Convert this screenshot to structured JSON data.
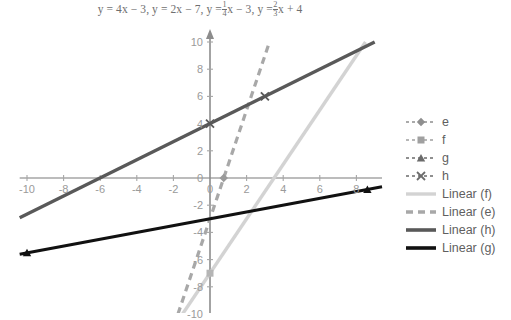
{
  "chart_data": {
    "type": "line",
    "title_parts": {
      "eq1": "y = 4x − 3,",
      "eq2": "y = 2x − 7,",
      "eq3_prefix": "y =",
      "eq3_num": "1",
      "eq3_den": "4",
      "eq3_suffix": "x − 3,",
      "eq4_prefix": "y =",
      "eq4_num": "2",
      "eq4_den": "3",
      "eq4_suffix": "x + 4"
    },
    "xlabel": "",
    "ylabel": "",
    "xlim": [
      -10.4,
      9.4
    ],
    "ylim": [
      -10,
      10
    ],
    "xticks": [
      -10,
      -8,
      -6,
      -4,
      -2,
      0,
      2,
      4,
      6,
      8
    ],
    "yticks": [
      10,
      8,
      6,
      4,
      2,
      0,
      -2,
      -4,
      -6,
      -8,
      -10
    ],
    "xtick_labels": [
      "-10",
      "-8",
      "-6",
      "-4",
      "-2",
      "0",
      "2",
      "4",
      "6",
      "8"
    ],
    "ytick_labels": [
      "10",
      "8",
      "6",
      "4",
      "2",
      "0",
      "-2",
      "-4",
      "-6",
      "-8",
      "-10"
    ],
    "grid": false,
    "legend_position": "right",
    "series": [
      {
        "name": "e",
        "equation": "y = 4x - 3",
        "slope": 4,
        "intercept": -3,
        "color": "#a8a8a8",
        "style": "dashed",
        "width": 3.2,
        "marker": "diamond",
        "points": [
          [
            -1.75,
            -10
          ],
          [
            3.25,
            10
          ]
        ]
      },
      {
        "name": "f",
        "equation": "y = 2x - 7",
        "slope": 2,
        "intercept": -7,
        "color": "#d3d3d3",
        "style": "solid",
        "width": 3.4,
        "marker": "square",
        "points": [
          [
            -1.5,
            -10
          ],
          [
            8.5,
            10
          ]
        ]
      },
      {
        "name": "g",
        "equation": "y = 1/4x - 3",
        "slope": 0.25,
        "intercept": -3,
        "color": "#111111",
        "style": "solid",
        "width": 3.0,
        "marker": "triangle",
        "points": [
          [
            -10.4,
            -5.6
          ],
          [
            9.4,
            -0.65
          ]
        ]
      },
      {
        "name": "h",
        "equation": "y = 2/3x + 4",
        "slope": 0.6667,
        "intercept": 4,
        "color": "#595959",
        "style": "solid",
        "width": 3.4,
        "marker": "cross",
        "points": [
          [
            -10.4,
            -2.93
          ],
          [
            9.0,
            10
          ]
        ]
      }
    ],
    "data_markers": [
      {
        "series": "f",
        "x": 0,
        "y": -7,
        "marker": "square"
      },
      {
        "series": "h",
        "x": 0,
        "y": 4,
        "marker": "cross"
      },
      {
        "series": "h",
        "x": 3,
        "y": 6,
        "marker": "cross"
      },
      {
        "series": "g",
        "x": -10,
        "y": -5.5,
        "marker": "triangle"
      },
      {
        "series": "g",
        "x": 8.6,
        "y": -0.85,
        "marker": "triangle"
      },
      {
        "series": "e",
        "x": 0.75,
        "y": 0,
        "marker": "diamond"
      }
    ],
    "legend": [
      {
        "label": "e",
        "key": "marker-diamond",
        "color": "#8f8f8f",
        "style": "dotted-line-marker"
      },
      {
        "label": "f",
        "key": "marker-square",
        "color": "#a0a0a0",
        "style": "dotted-line-marker"
      },
      {
        "label": "g",
        "key": "marker-triangle",
        "color": "#6b6b6b",
        "style": "dotted-line-marker"
      },
      {
        "label": "h",
        "key": "marker-cross",
        "color": "#6b6b6b",
        "style": "dotted-line-marker"
      },
      {
        "label": "Linear (f)",
        "key": "line-f",
        "color": "#d3d3d3",
        "style": "solid"
      },
      {
        "label": "Linear (e)",
        "key": "line-e",
        "color": "#a8a8a8",
        "style": "dashed"
      },
      {
        "label": "Linear (h)",
        "key": "line-h",
        "color": "#595959",
        "style": "solid"
      },
      {
        "label": "Linear (g)",
        "key": "line-g",
        "color": "#111111",
        "style": "solid"
      }
    ]
  }
}
